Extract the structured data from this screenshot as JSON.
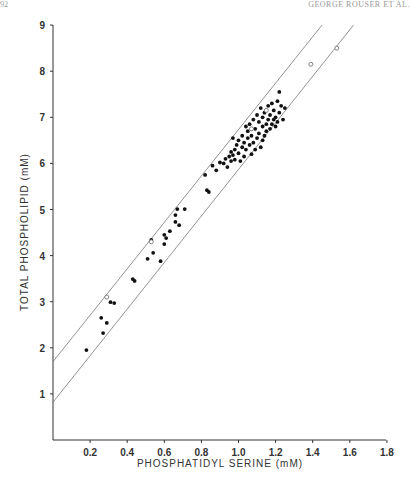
{
  "page": {
    "header_left": "92",
    "header_right": "GEORGE ROUSER ET AL."
  },
  "chart_data": {
    "type": "scatter",
    "title": "",
    "xlabel": "PHOSPHATIDYL SERINE (mM)",
    "ylabel": "TOTAL PHOSPHOLIPID (mM)",
    "xlim": [
      0,
      1.8
    ],
    "ylim": [
      0,
      9
    ],
    "x_ticks": [
      "0.2",
      "0.4",
      "0.6",
      "0.8",
      "1.0",
      "1.2",
      "1.4",
      "1.6",
      "1.8"
    ],
    "y_ticks": [
      "1",
      "2",
      "3",
      "4",
      "5",
      "6",
      "7",
      "8",
      "9"
    ],
    "grid": false,
    "legend": null,
    "series": [
      {
        "name": "filled",
        "marker": "filled-circle",
        "points": [
          [
            0.18,
            1.95
          ],
          [
            0.26,
            2.65
          ],
          [
            0.27,
            2.32
          ],
          [
            0.29,
            2.54
          ],
          [
            0.31,
            2.99
          ],
          [
            0.33,
            2.97
          ],
          [
            0.43,
            3.49
          ],
          [
            0.44,
            3.45
          ],
          [
            0.51,
            3.93
          ],
          [
            0.54,
            4.06
          ],
          [
            0.58,
            3.88
          ],
          [
            0.53,
            4.34
          ],
          [
            0.6,
            4.45
          ],
          [
            0.61,
            4.38
          ],
          [
            0.6,
            4.25
          ],
          [
            0.63,
            4.53
          ],
          [
            0.66,
            4.73
          ],
          [
            0.68,
            4.66
          ],
          [
            0.66,
            4.88
          ],
          [
            0.67,
            5.01
          ],
          [
            0.71,
            5.01
          ],
          [
            0.83,
            5.42
          ],
          [
            0.84,
            5.38
          ],
          [
            0.82,
            5.75
          ],
          [
            0.86,
            5.95
          ],
          [
            0.88,
            5.85
          ],
          [
            0.9,
            6.02
          ],
          [
            0.92,
            6.0
          ],
          [
            0.93,
            6.1
          ],
          [
            0.94,
            5.92
          ],
          [
            0.95,
            6.15
          ],
          [
            0.96,
            6.05
          ],
          [
            0.96,
            6.25
          ],
          [
            0.97,
            6.18
          ],
          [
            0.98,
            6.3
          ],
          [
            0.98,
            6.08
          ],
          [
            0.99,
            6.4
          ],
          [
            1.0,
            6.22
          ],
          [
            1.0,
            6.5
          ],
          [
            1.01,
            6.05
          ],
          [
            1.02,
            6.35
          ],
          [
            1.02,
            6.6
          ],
          [
            1.03,
            6.15
          ],
          [
            1.03,
            6.45
          ],
          [
            1.04,
            6.3
          ],
          [
            1.05,
            6.7
          ],
          [
            1.05,
            6.55
          ],
          [
            1.06,
            6.4
          ],
          [
            1.06,
            6.85
          ],
          [
            1.07,
            6.2
          ],
          [
            1.07,
            6.6
          ],
          [
            1.08,
            6.95
          ],
          [
            1.08,
            6.45
          ],
          [
            1.09,
            6.75
          ],
          [
            1.1,
            6.55
          ],
          [
            1.1,
            7.05
          ],
          [
            1.11,
            6.65
          ],
          [
            1.11,
            6.9
          ],
          [
            1.12,
            6.35
          ],
          [
            1.12,
            7.2
          ],
          [
            1.13,
            6.8
          ],
          [
            1.13,
            7.0
          ],
          [
            1.14,
            6.6
          ],
          [
            1.14,
            7.1
          ],
          [
            1.15,
            6.85
          ],
          [
            1.15,
            6.7
          ],
          [
            1.16,
            7.25
          ],
          [
            1.16,
            6.95
          ],
          [
            1.17,
            6.75
          ],
          [
            1.17,
            7.05
          ],
          [
            1.18,
            6.85
          ],
          [
            1.18,
            7.3
          ],
          [
            1.19,
            6.95
          ],
          [
            1.19,
            7.15
          ],
          [
            1.2,
            6.8
          ],
          [
            1.2,
            7.0
          ],
          [
            1.21,
            7.35
          ],
          [
            1.21,
            6.9
          ],
          [
            1.22,
            7.1
          ],
          [
            1.22,
            7.55
          ],
          [
            1.23,
            7.25
          ],
          [
            1.24,
            6.95
          ],
          [
            1.25,
            7.2
          ],
          [
            1.13,
            6.5
          ],
          [
            1.09,
            6.3
          ],
          [
            1.04,
            6.8
          ],
          [
            0.97,
            6.55
          ]
        ]
      },
      {
        "name": "open",
        "marker": "open-circle",
        "points": [
          [
            0.29,
            3.1
          ],
          [
            0.53,
            4.3
          ],
          [
            1.39,
            8.15
          ],
          [
            1.53,
            8.5
          ],
          [
            1.07,
            6.75
          ],
          [
            1.15,
            7.15
          ]
        ]
      }
    ],
    "reference_lines": [
      {
        "name": "upper-bound",
        "x": [
          0.0,
          1.45
        ],
        "y": [
          1.7,
          9.0
        ]
      },
      {
        "name": "lower-bound",
        "x": [
          0.0,
          1.62
        ],
        "y": [
          0.82,
          9.0
        ]
      }
    ]
  }
}
